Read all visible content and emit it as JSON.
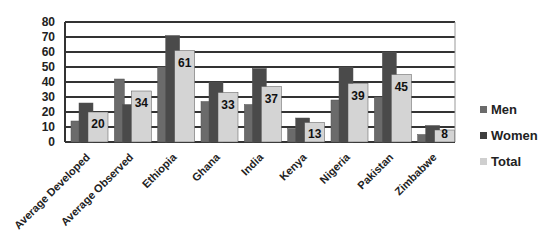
{
  "chart_data": {
    "type": "bar",
    "title": "",
    "xlabel": "",
    "ylabel": "",
    "ylim": [
      0,
      80
    ],
    "yticks": [
      "0",
      "10",
      "20",
      "30",
      "40",
      "50",
      "60",
      "70",
      "80"
    ],
    "grid": true,
    "legend_position": "right",
    "categories": [
      "Average Developed",
      "Average Observed",
      "Ethiopia",
      "Ghana",
      "India",
      "Kenya",
      "Nigeria",
      "Pakistan",
      "Zimbabwe"
    ],
    "series": [
      {
        "name": "Men",
        "color": "#6b6b6b",
        "values": [
          14,
          42,
          50,
          27,
          25,
          9,
          28,
          30,
          5
        ]
      },
      {
        "name": "Women",
        "color": "#4a4a4a",
        "values": [
          26,
          25,
          71,
          40,
          49,
          16,
          50,
          60,
          11
        ]
      },
      {
        "name": "Total",
        "color": "#d4d4d4",
        "values": [
          20,
          34,
          61,
          33,
          37,
          13,
          39,
          45,
          8
        ],
        "data_labels": [
          "20",
          "34",
          "61",
          "33",
          "37",
          "13",
          "39",
          "45",
          "8"
        ]
      }
    ]
  }
}
